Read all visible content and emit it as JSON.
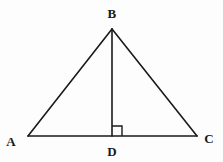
{
  "figure": {
    "kind": "geometry-diagram",
    "background_color": "#fdfdfd",
    "stroke_color": "#1a1a1a",
    "stroke_width": 1.6,
    "width": 223,
    "height": 162
  },
  "labels": {
    "a": "A",
    "b": "B",
    "c": "C",
    "d": "D"
  },
  "points": {
    "A": {
      "x": 28,
      "y": 136
    },
    "B": {
      "x": 112,
      "y": 29
    },
    "C": {
      "x": 197,
      "y": 136
    },
    "D": {
      "x": 112,
      "y": 136
    }
  },
  "segments": [
    {
      "name": "AB",
      "x1": 28,
      "y1": 136,
      "x2": 112,
      "y2": 29
    },
    {
      "name": "BC",
      "x1": 112,
      "y1": 29,
      "x2": 197,
      "y2": 136
    },
    {
      "name": "AC",
      "x1": 28,
      "y1": 136,
      "x2": 197,
      "y2": 136
    },
    {
      "name": "BD",
      "x1": 112,
      "y1": 29,
      "x2": 112,
      "y2": 136
    }
  ],
  "right_angle_marker": {
    "at_point": "D",
    "size": 10,
    "side": "right",
    "path": "M 112 126 L 122 126 L 122 136"
  }
}
